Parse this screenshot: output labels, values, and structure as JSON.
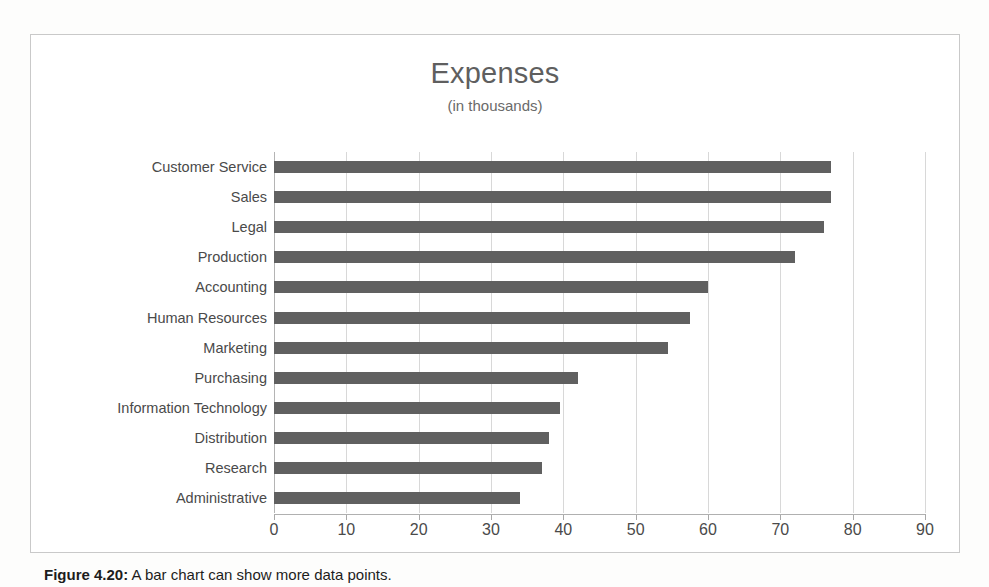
{
  "caption": {
    "label": "Figure 4.20:",
    "text": "A bar chart can show more data points."
  },
  "chart_data": {
    "type": "bar",
    "orientation": "horizontal",
    "title": "Expenses",
    "subtitle": "(in thousands)",
    "xlabel": "",
    "ylabel": "",
    "xlim": [
      0,
      90
    ],
    "xticks": [
      0,
      10,
      20,
      30,
      40,
      50,
      60,
      70,
      80,
      90
    ],
    "grid": "vertical",
    "legend": "none",
    "bar_color": "#606060",
    "categories": [
      "Customer Service",
      "Sales",
      "Legal",
      "Production",
      "Accounting",
      "Human Resources",
      "Marketing",
      "Purchasing",
      "Information Technology",
      "Distribution",
      "Research",
      "Administrative"
    ],
    "values": [
      77,
      77,
      76,
      72,
      60,
      57.5,
      54.5,
      42,
      39.5,
      38,
      37,
      34
    ]
  }
}
